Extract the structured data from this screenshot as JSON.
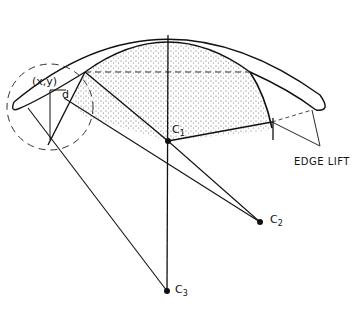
{
  "labels": {
    "point": "(x,y)",
    "distance": "d",
    "c1_main": "C",
    "c1_sub": "1",
    "c2_main": "C",
    "c2_sub": "2",
    "c3_main": "C",
    "c3_sub": "3",
    "edge_lift": "EDGE LIFT"
  },
  "colors": {
    "ink": "#111111",
    "stipple": "#555555",
    "background": "#ffffff"
  }
}
